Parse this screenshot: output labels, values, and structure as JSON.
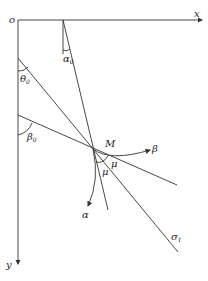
{
  "diagram": {
    "type": "slip-line geometry",
    "labels": {
      "origin": "o",
      "x_axis": "x",
      "y_axis": "y",
      "alpha0": "α",
      "alpha0_sub": "0",
      "theta0": "θ",
      "theta0_sub": "0",
      "beta0": "β",
      "beta0_sub": "0",
      "point_m": "M",
      "beta_curve": "β",
      "alpha_curve": "α",
      "mu_1": "μ",
      "mu_2": "μ",
      "sigma1": "σ",
      "sigma1_sub": "1"
    },
    "colors": {
      "stroke": "#333333",
      "background": "#ffffff"
    }
  }
}
